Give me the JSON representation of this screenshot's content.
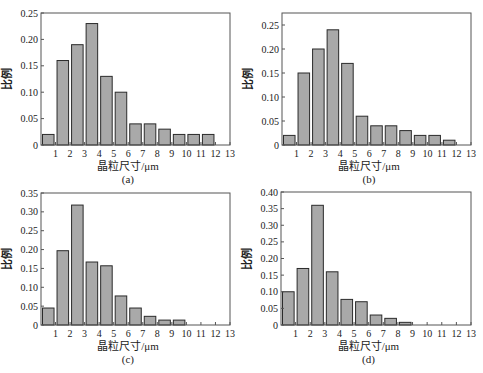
{
  "colors": {
    "bar_fill": "#a9a9a9",
    "bar_stroke": "#2b2b2b",
    "frame": "#555555"
  },
  "chart_data": [
    {
      "type": "bar",
      "panel": "(a)",
      "xlabel": "晶粒尺寸/μm",
      "ylabel": "比例",
      "xticks": [
        1,
        2,
        3,
        4,
        5,
        6,
        7,
        8,
        9,
        10,
        11,
        12,
        13
      ],
      "xlim": [
        0,
        13
      ],
      "ylim": [
        0,
        0.25
      ],
      "yticks": [
        "0",
        "0.05",
        "0.10",
        "0.15",
        "0.20",
        "0.25"
      ],
      "ytick_values": [
        0,
        0.05,
        0.1,
        0.15,
        0.2,
        0.25
      ],
      "bins": [
        [
          0,
          1
        ],
        [
          1,
          2
        ],
        [
          2,
          3
        ],
        [
          3,
          4
        ],
        [
          4,
          5
        ],
        [
          5,
          6
        ],
        [
          6,
          7
        ],
        [
          7,
          8
        ],
        [
          8,
          9
        ],
        [
          9,
          10
        ],
        [
          10,
          11
        ],
        [
          11,
          12
        ],
        [
          12,
          13
        ]
      ],
      "values": [
        0.02,
        0.16,
        0.19,
        0.23,
        0.13,
        0.1,
        0.04,
        0.04,
        0.03,
        0.02,
        0.02,
        0.02,
        0
      ],
      "frame": {
        "x": 41,
        "y": 13,
        "w": 189,
        "h": 132
      }
    },
    {
      "type": "bar",
      "panel": "(b)",
      "xlabel": "晶粒尺寸/μm",
      "ylabel": "比例",
      "xticks": [
        1,
        2,
        3,
        4,
        5,
        6,
        7,
        8,
        9,
        10,
        11,
        12,
        13
      ],
      "xlim": [
        0,
        13
      ],
      "ylim": [
        0,
        0.275
      ],
      "yticks": [
        "0",
        "0.05",
        "0.10",
        "0.15",
        "0.20",
        "0.25"
      ],
      "ytick_values": [
        0,
        0.05,
        0.1,
        0.15,
        0.2,
        0.25
      ],
      "bins": [
        [
          0,
          1
        ],
        [
          1,
          2
        ],
        [
          2,
          3
        ],
        [
          3,
          4
        ],
        [
          4,
          5
        ],
        [
          5,
          6
        ],
        [
          6,
          7
        ],
        [
          7,
          8
        ],
        [
          8,
          9
        ],
        [
          9,
          10
        ],
        [
          10,
          11
        ],
        [
          11,
          12
        ],
        [
          12,
          13
        ]
      ],
      "values": [
        0.02,
        0.15,
        0.2,
        0.24,
        0.17,
        0.06,
        0.04,
        0.04,
        0.03,
        0.02,
        0.02,
        0.01,
        0
      ],
      "frame": {
        "x": 282,
        "y": 13,
        "w": 189,
        "h": 132
      }
    },
    {
      "type": "bar",
      "panel": "(c)",
      "xlabel": "晶粒尺寸/μm",
      "ylabel": "比例",
      "xticks": [
        1,
        2,
        3,
        4,
        5,
        6,
        7,
        8,
        9,
        10,
        11,
        12,
        13
      ],
      "xlim": [
        0,
        13
      ],
      "ylim": [
        0,
        0.35
      ],
      "yticks": [
        "0",
        "0.05",
        "0.10",
        "0.15",
        "0.20",
        "0.25",
        "0.30",
        "0.35"
      ],
      "ytick_values": [
        0,
        0.05,
        0.1,
        0.15,
        0.2,
        0.25,
        0.3,
        0.35
      ],
      "bins": [
        [
          0,
          1
        ],
        [
          1,
          2
        ],
        [
          2,
          3
        ],
        [
          3,
          4
        ],
        [
          4,
          5
        ],
        [
          5,
          6
        ],
        [
          6,
          7
        ],
        [
          7,
          8
        ],
        [
          8,
          9
        ],
        [
          9,
          10
        ],
        [
          10,
          11
        ],
        [
          11,
          12
        ],
        [
          12,
          13
        ]
      ],
      "values": [
        0.045,
        0.197,
        0.318,
        0.167,
        0.157,
        0.077,
        0.045,
        0.023,
        0.013,
        0.013,
        0,
        0,
        0
      ],
      "frame": {
        "x": 41,
        "y": 193,
        "w": 189,
        "h": 132
      }
    },
    {
      "type": "bar",
      "panel": "(d)",
      "xlabel": "晶粒尺寸/μm",
      "ylabel": "比例",
      "xticks": [
        1,
        2,
        3,
        4,
        5,
        6,
        7,
        8,
        9,
        10,
        11,
        12,
        13
      ],
      "xlim": [
        0,
        13
      ],
      "ylim": [
        0,
        0.4
      ],
      "yticks": [
        "0",
        "0.05",
        "0.10",
        "0.15",
        "0.20",
        "0.25",
        "0.30",
        "0.35",
        "0.40"
      ],
      "ytick_values": [
        0,
        0.05,
        0.1,
        0.15,
        0.2,
        0.25,
        0.3,
        0.35,
        0.4
      ],
      "bins": [
        [
          0,
          1
        ],
        [
          1,
          2
        ],
        [
          2,
          3
        ],
        [
          3,
          4
        ],
        [
          4,
          5
        ],
        [
          5,
          6
        ],
        [
          6,
          7
        ],
        [
          7,
          8
        ],
        [
          8,
          9
        ],
        [
          9,
          10
        ],
        [
          10,
          11
        ],
        [
          11,
          12
        ],
        [
          12,
          13
        ]
      ],
      "values": [
        0.1,
        0.17,
        0.36,
        0.16,
        0.077,
        0.07,
        0.03,
        0.02,
        0.008,
        0,
        0,
        0,
        0
      ],
      "frame": {
        "x": 281,
        "y": 192,
        "w": 190,
        "h": 133
      }
    }
  ]
}
